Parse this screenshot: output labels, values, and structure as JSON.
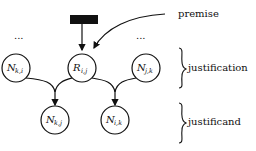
{
  "diagram": {
    "premise_label": "premise",
    "justification_label": "justification",
    "justificand_label": "justificand",
    "ellipsis_left": "...",
    "ellipsis_right": "...",
    "nodes": {
      "n_ki": {
        "main": "N",
        "sub": "k,i"
      },
      "r_ij": {
        "main": "R",
        "sub": "i,j"
      },
      "n_jk": {
        "main": "N",
        "sub": "j,k"
      },
      "n_kj": {
        "main": "N",
        "sub": "k,j"
      },
      "n_ik": {
        "main": "N",
        "sub": "i,k"
      }
    },
    "colors": {
      "stroke": "#111111",
      "premise_box": "#111111",
      "background": "#ffffff"
    }
  }
}
